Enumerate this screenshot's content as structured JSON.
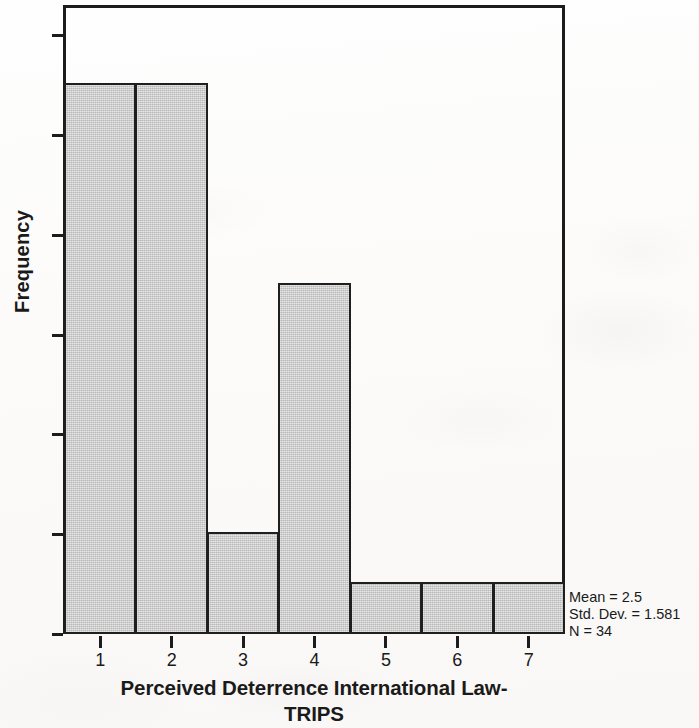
{
  "chart_data": {
    "type": "bar",
    "title": "",
    "xlabel": "Perceived Deterrence International Law-TRIPS",
    "ylabel": "Frequency",
    "categories": [
      "1",
      "2",
      "3",
      "4",
      "5",
      "6",
      "7"
    ],
    "values": [
      11,
      11,
      2,
      7,
      1,
      1,
      1
    ],
    "x_tick_labels": [
      "1",
      "2",
      "3",
      "4",
      "5",
      "6",
      "7"
    ],
    "y_tick_labels": [
      "0",
      "2",
      "4",
      "6",
      "8",
      "10",
      "12"
    ],
    "y_tick_values": [
      0,
      2,
      4,
      6,
      8,
      10,
      12
    ],
    "ylim": [
      0,
      12.6
    ],
    "xlim": [
      0.5,
      7.5
    ],
    "grid": false,
    "legend": "none",
    "bar_fill_color": "#cacaca",
    "bar_edge_color": "#1f1f1f",
    "axis_color": "#1c1c1c",
    "background_color": "#fdfcfa",
    "annotations": {
      "mean": "Mean = 2.5",
      "std_dev": "Std. Dev. = 1.581",
      "n": "N = 34"
    }
  },
  "axes": {
    "y_title": "Frequency",
    "x_title_line1": "Perceived Deterrence International Law-",
    "x_title_line2": "TRIPS"
  },
  "ticks": {
    "y": [
      {
        "label": "12",
        "value": 12
      },
      {
        "label": "10",
        "value": 10
      },
      {
        "label": "8",
        "value": 8
      },
      {
        "label": "6",
        "value": 6
      },
      {
        "label": "4",
        "value": 4
      },
      {
        "label": "2",
        "value": 2
      },
      {
        "label": "0",
        "value": 0
      }
    ],
    "x": [
      {
        "label": "1",
        "value": 1
      },
      {
        "label": "2",
        "value": 2
      },
      {
        "label": "3",
        "value": 3
      },
      {
        "label": "4",
        "value": 4
      },
      {
        "label": "5",
        "value": 5
      },
      {
        "label": "6",
        "value": 6
      },
      {
        "label": "7",
        "value": 7
      }
    ]
  },
  "stats": {
    "mean": "Mean = 2.5",
    "std_dev": "Std. Dev. = 1.581",
    "n": "N = 34"
  }
}
